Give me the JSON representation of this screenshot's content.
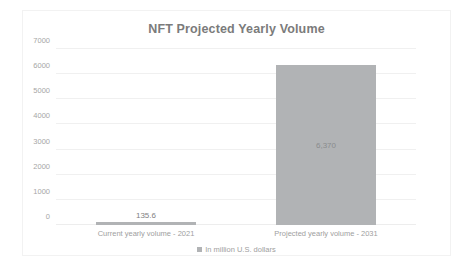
{
  "chart_data": {
    "type": "bar",
    "title": "NFT Projected Yearly Volume",
    "xlabel": "",
    "ylabel": "",
    "categories": [
      "Current yearly volume - 2021",
      "Projected yearly volume - 2031"
    ],
    "values": [
      135.6,
      6370
    ],
    "value_labels": [
      "135.6",
      "6,370"
    ],
    "series": [
      {
        "name": "In million U.S. dollars",
        "values": [
          135.6,
          6370
        ],
        "color": "#b1b3b5"
      }
    ],
    "ylim": [
      0,
      7000
    ],
    "ytick_values": [
      0,
      1000,
      2000,
      3000,
      4000,
      5000,
      6000,
      7000
    ],
    "ytick_labels": [
      "0",
      "1000",
      "2000",
      "3000",
      "4000",
      "5000",
      "6000",
      "7000"
    ],
    "grid": true,
    "legend_position": "bottom",
    "legend_entries": [
      "In million U.S. dollars"
    ]
  },
  "legend": {
    "marker_name": "legend-square-marker",
    "label": "In million U.S. dollars"
  },
  "colors": {
    "bar": "#b1b3b5",
    "title_text": "#7b7b7b",
    "axis_text": "#a0a0a0",
    "gridline": "#f0f0f0",
    "card_border": "#f2f2f2",
    "background": "#ffffff"
  }
}
